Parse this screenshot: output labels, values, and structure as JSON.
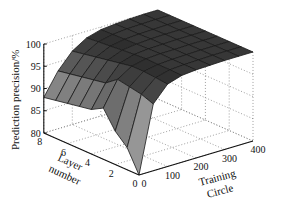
{
  "chart_data": {
    "type": "surface3d",
    "title": "",
    "xlabel": "Training Circle",
    "ylabel": "Layer number",
    "zlabel": "Prediction precision/%",
    "x_ticks": [
      0,
      100,
      200,
      300,
      400
    ],
    "y_ticks": [
      0,
      2,
      4,
      6,
      8
    ],
    "z_ticks": [
      80,
      85,
      90,
      95,
      100
    ],
    "xlim": [
      0,
      400
    ],
    "ylim": [
      0,
      8
    ],
    "zlim": [
      80,
      100
    ],
    "grid": true,
    "grid_style": "dotted",
    "colormap": "gray",
    "x": [
      0,
      50,
      100,
      150,
      200,
      250,
      300,
      350,
      400
    ],
    "y": [
      0,
      1,
      2,
      3,
      4,
      5,
      6,
      7,
      8
    ],
    "z": [
      [
        80.0,
        95.0,
        98.5,
        99.5,
        99.8,
        99.9,
        100.0,
        100.0,
        100.0
      ],
      [
        85.0,
        96.0,
        98.8,
        99.6,
        99.8,
        99.9,
        100.0,
        100.0,
        100.0
      ],
      [
        87.5,
        96.5,
        99.0,
        99.6,
        99.8,
        99.9,
        100.0,
        100.0,
        100.0
      ],
      [
        91.5,
        97.0,
        99.0,
        99.7,
        99.9,
        99.9,
        100.0,
        100.0,
        100.0
      ],
      [
        90.0,
        95.0,
        98.5,
        99.5,
        99.8,
        99.9,
        100.0,
        100.0,
        100.0
      ],
      [
        89.5,
        94.5,
        98.0,
        99.3,
        99.7,
        99.9,
        100.0,
        100.0,
        100.0
      ],
      [
        89.0,
        94.0,
        97.5,
        99.0,
        99.6,
        99.8,
        99.9,
        100.0,
        100.0
      ],
      [
        88.5,
        93.5,
        97.0,
        98.8,
        99.5,
        99.8,
        99.9,
        100.0,
        100.0
      ],
      [
        88.0,
        93.0,
        96.5,
        98.5,
        99.4,
        99.7,
        99.9,
        100.0,
        100.0
      ]
    ]
  },
  "labels": {
    "zlabel": "Prediction precision/%",
    "ylabel_line1": "Layer",
    "ylabel_line2": "number",
    "xlabel_line1": "Training",
    "xlabel_line2": "Circle"
  }
}
